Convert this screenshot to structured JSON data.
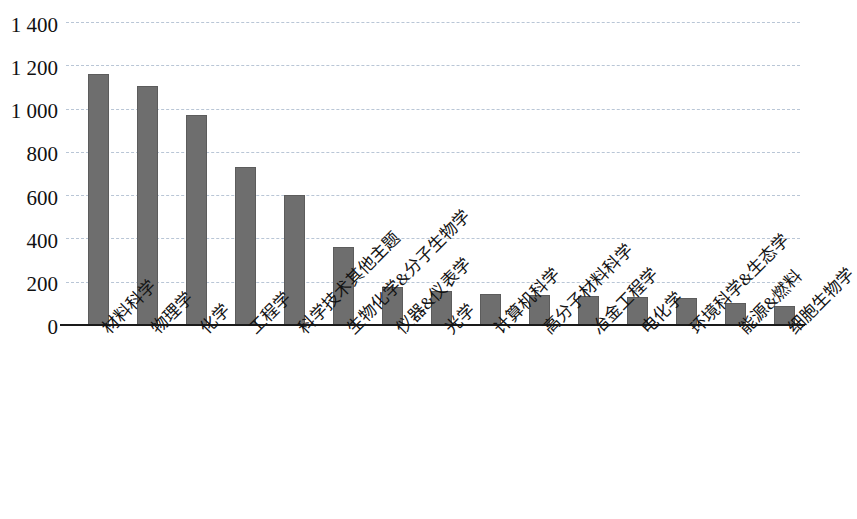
{
  "chart_data": {
    "type": "bar",
    "title": "",
    "subtitle": "",
    "xlabel": "",
    "ylabel": "",
    "ylim": [
      0,
      1400
    ],
    "ytick_step": 200,
    "grid": true,
    "grid_axis": "y",
    "legend": "none",
    "bar_color": "#6e6e6e",
    "grid_color": "#b9c6d6",
    "axis_color": "#1a1a1a",
    "background_color": "#ffffff",
    "y_tick_labels": [
      "1 400",
      "1 200",
      "1 000",
      "800",
      "600",
      "400",
      "200",
      "0"
    ],
    "y_tick_values": [
      1400,
      1200,
      1000,
      800,
      600,
      400,
      200,
      0
    ],
    "categories": [
      "材料科学",
      "物理学",
      "化学",
      "工程学",
      "科学技术其他主题",
      "生物化学&分子生物学",
      "仪器&仪表学",
      "光学",
      "计算机科学",
      "高分子材料科学",
      "冶金工程学",
      "电化学",
      "环境科学&生态学",
      "能源&燃料",
      "细胞生物学"
    ],
    "values": [
      1160,
      1105,
      970,
      730,
      600,
      360,
      175,
      155,
      145,
      140,
      135,
      128,
      125,
      100,
      90
    ]
  }
}
